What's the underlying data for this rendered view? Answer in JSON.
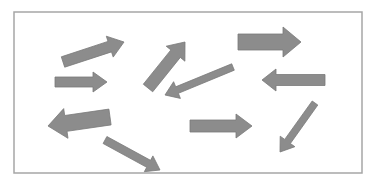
{
  "diagram": {
    "title": "",
    "frame": {
      "x": 14,
      "y": 12,
      "width": 348,
      "height": 161,
      "stroke": "#a6a6a6",
      "fill": "#ffffff"
    },
    "arrow_style": {
      "fill": "#8c8c8c",
      "stroke": "#7a7a7a"
    },
    "arrows": [
      {
        "id": "arrow-1",
        "direction": "right-up",
        "tail": [
          63,
          62
        ],
        "head": [
          124,
          42
        ],
        "shaft": 11,
        "headW": 22,
        "headL": 15
      },
      {
        "id": "arrow-2",
        "direction": "right",
        "tail": [
          55,
          82
        ],
        "head": [
          107,
          82
        ],
        "shaft": 10,
        "headW": 20,
        "headL": 14
      },
      {
        "id": "arrow-3",
        "direction": "up-right",
        "tail": [
          148,
          88
        ],
        "head": [
          185,
          42
        ],
        "shaft": 12,
        "headW": 24,
        "headL": 15
      },
      {
        "id": "arrow-4",
        "direction": "left-down",
        "tail": [
          233,
          67
        ],
        "head": [
          165,
          95
        ],
        "shaft": 7,
        "headW": 18,
        "headL": 13
      },
      {
        "id": "arrow-5",
        "direction": "right",
        "tail": [
          238,
          42
        ],
        "head": [
          301,
          42
        ],
        "shaft": 16,
        "headW": 30,
        "headL": 18
      },
      {
        "id": "arrow-6",
        "direction": "left",
        "tail": [
          325,
          80
        ],
        "head": [
          262,
          80
        ],
        "shaft": 11,
        "headW": 22,
        "headL": 14
      },
      {
        "id": "arrow-7",
        "direction": "left",
        "tail": [
          110,
          117
        ],
        "head": [
          48,
          126
        ],
        "shaft": 16,
        "headW": 30,
        "headL": 18
      },
      {
        "id": "arrow-8",
        "direction": "right-down",
        "tail": [
          105,
          140
        ],
        "head": [
          160,
          170
        ],
        "shaft": 8,
        "headW": 18,
        "headL": 13
      },
      {
        "id": "arrow-9",
        "direction": "right",
        "tail": [
          190,
          126
        ],
        "head": [
          252,
          126
        ],
        "shaft": 12,
        "headW": 24,
        "headL": 16
      },
      {
        "id": "arrow-10",
        "direction": "down-left",
        "tail": [
          315,
          103
        ],
        "head": [
          280,
          152
        ],
        "shaft": 7,
        "headW": 18,
        "headL": 13
      }
    ]
  }
}
